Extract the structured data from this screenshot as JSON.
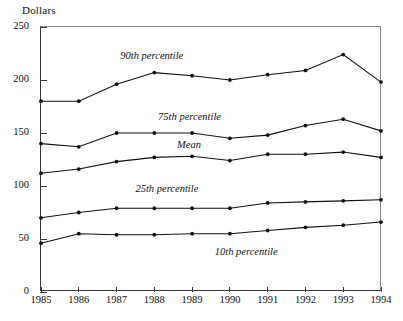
{
  "chart_data": {
    "type": "line",
    "title": "",
    "ylabel": "Dollars",
    "xlabel": "",
    "ylim": [
      0,
      250
    ],
    "yticks": [
      0,
      50,
      100,
      150,
      200,
      250
    ],
    "grid": false,
    "legend_position": "inline-annotations",
    "categories": [
      "1985",
      "1986",
      "1987",
      "1988",
      "1989",
      "1990",
      "1991",
      "1992",
      "1993",
      "1994"
    ],
    "x": [
      1985,
      1986,
      1987,
      1988,
      1989,
      1990,
      1991,
      1992,
      1993,
      1994
    ],
    "series": [
      {
        "name": "90th percentile",
        "label": "90th percentile",
        "values": [
          180,
          180,
          196,
          207,
          204,
          200,
          205,
          209,
          224,
          198
        ]
      },
      {
        "name": "75th percentile",
        "label": "75th percentile",
        "values": [
          140,
          137,
          150,
          150,
          150,
          145,
          148,
          157,
          163,
          152
        ]
      },
      {
        "name": "Mean",
        "label": "Mean",
        "values": [
          112,
          116,
          123,
          127,
          128,
          124,
          130,
          130,
          132,
          127
        ]
      },
      {
        "name": "25th percentile",
        "label": "25th percentile",
        "values": [
          70,
          75,
          79,
          79,
          79,
          79,
          84,
          85,
          86,
          87
        ]
      },
      {
        "name": "10th percentile",
        "label": "10th percentile",
        "values": [
          46,
          55,
          54,
          54,
          55,
          55,
          58,
          61,
          63,
          66
        ]
      }
    ],
    "annotations": [
      {
        "text": "90th percentile",
        "x": 1987.1,
        "y": 222
      },
      {
        "text": "75th percentile",
        "x": 1988.1,
        "y": 164
      },
      {
        "text": "Mean",
        "x": 1988.6,
        "y": 138
      },
      {
        "text": "25th percentile",
        "x": 1987.5,
        "y": 96
      },
      {
        "text": "10th percentile",
        "x": 1989.6,
        "y": 37
      }
    ]
  },
  "colors": {
    "line": "#111111",
    "marker": "#111111",
    "axis": "#3a3a3a",
    "frame": "#8a8a8a",
    "background": "#ffffff"
  }
}
